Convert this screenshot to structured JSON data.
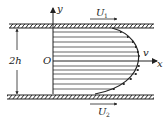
{
  "diagram": {
    "labels": {
      "y_axis": "y",
      "x_axis": "x",
      "origin": "O",
      "gap": "2h",
      "velocity": "v",
      "top_plate_velocity": "U",
      "top_plate_velocity_sub": "1",
      "bottom_plate_velocity": "U",
      "bottom_plate_velocity_sub": "2"
    },
    "colors": {
      "line": "#222222",
      "background": "#ffffff"
    },
    "profile_arrow_count": 13
  }
}
